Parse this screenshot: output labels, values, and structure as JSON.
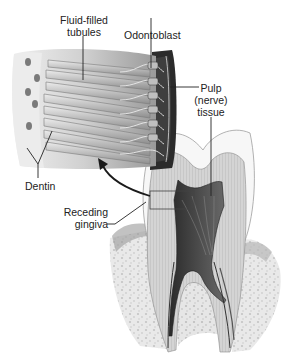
{
  "diagram": {
    "labels": {
      "fluid_filled_tubules_line1": "Fluid-filled",
      "fluid_filled_tubules_line2": "tubules",
      "odontoblast": "Odontoblast",
      "pulp_line1": "Pulp",
      "pulp_line2": "(nerve)",
      "pulp_line3": "tissue",
      "dentin": "Dentin",
      "receding_gingiva_line1": "Receding",
      "receding_gingiva_line2": "gingiva"
    },
    "colors": {
      "enamel": "#f4f4f4",
      "dentin": "#cfcfcf",
      "pulp": "#555555",
      "bone": "#e2e2e2",
      "line": "#222222"
    }
  }
}
